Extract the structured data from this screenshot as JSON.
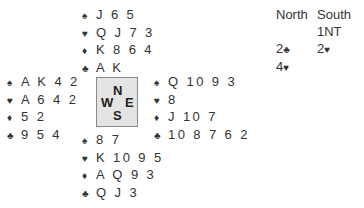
{
  "suit_icons": {
    "spades": "♠",
    "hearts": "♥",
    "diamonds": "♦",
    "clubs": "♣"
  },
  "compass": {
    "n": "N",
    "w": "W",
    "e": "E",
    "s": "S"
  },
  "hands": {
    "north": {
      "spades": "J 6 5",
      "hearts": "Q J 7 3",
      "diamonds": "K 8 6 4",
      "clubs": "A K"
    },
    "west": {
      "spades": "A K 4 2",
      "hearts": "A 6 4 2",
      "diamonds": "5 2",
      "clubs": "9 5 4"
    },
    "east": {
      "spades": "Q 10 9 3",
      "hearts": "8",
      "diamonds": "J 10 7",
      "clubs": "10 8 7 6 2"
    },
    "south": {
      "spades": "8 7",
      "hearts": "K 10 9 5",
      "diamonds": "A Q 9 3",
      "clubs": "Q J 3"
    }
  },
  "auction": {
    "headers": [
      "North",
      "South"
    ],
    "rows": [
      {
        "north": "",
        "north_suit": "",
        "south": "1NT",
        "south_suit": ""
      },
      {
        "north": "2",
        "north_suit": "♣",
        "south": "2",
        "south_suit": "♥"
      },
      {
        "north": "4",
        "north_suit": "♥",
        "south": "",
        "south_suit": ""
      }
    ]
  }
}
